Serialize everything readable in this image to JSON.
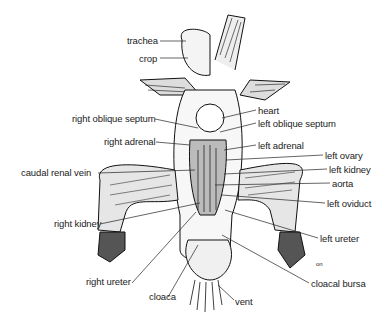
{
  "diagram": {
    "type": "anatomical-illustration",
    "labels": [
      {
        "id": "trachea",
        "text": "trachea",
        "x": 127,
        "y": 35,
        "side": "left"
      },
      {
        "id": "crop",
        "text": "crop",
        "x": 139,
        "y": 53,
        "side": "left"
      },
      {
        "id": "right-oblique-septum",
        "text": "right oblique septum",
        "x": 72,
        "y": 113,
        "side": "left"
      },
      {
        "id": "right-adrenal",
        "text": "right adrenal",
        "x": 104,
        "y": 136,
        "side": "left"
      },
      {
        "id": "caudal-renal-vein",
        "text": "caudal renal vein",
        "x": 21,
        "y": 167,
        "side": "left"
      },
      {
        "id": "right-kidney",
        "text": "right kidney",
        "x": 54,
        "y": 218,
        "side": "left"
      },
      {
        "id": "right-ureter",
        "text": "right ureter",
        "x": 86,
        "y": 276,
        "side": "left"
      },
      {
        "id": "cloaca",
        "text": "cloaca",
        "x": 149,
        "y": 291,
        "side": "bottom"
      },
      {
        "id": "vent",
        "text": "vent",
        "x": 235,
        "y": 296,
        "side": "bottom"
      },
      {
        "id": "heart",
        "text": "heart",
        "x": 258,
        "y": 105,
        "side": "right"
      },
      {
        "id": "left-oblique-septum",
        "text": "left oblique septum",
        "x": 258,
        "y": 118,
        "side": "right"
      },
      {
        "id": "left-adrenal",
        "text": "left adrenal",
        "x": 258,
        "y": 140,
        "side": "right"
      },
      {
        "id": "left-ovary",
        "text": "left ovary",
        "x": 325,
        "y": 150,
        "side": "right"
      },
      {
        "id": "left-kidney",
        "text": "left kidney",
        "x": 329,
        "y": 164,
        "side": "right"
      },
      {
        "id": "aorta",
        "text": "aorta",
        "x": 332,
        "y": 178,
        "side": "right"
      },
      {
        "id": "left-oviduct",
        "text": "left oviduct",
        "x": 327,
        "y": 198,
        "side": "right"
      },
      {
        "id": "left-ureter",
        "text": "left ureter",
        "x": 320,
        "y": 233,
        "side": "right"
      },
      {
        "id": "cloacal-bursa",
        "text": "cloacal bursa",
        "x": 311,
        "y": 278,
        "side": "right"
      }
    ],
    "annotations": [
      {
        "text": "on",
        "x": 316,
        "y": 259
      }
    ]
  }
}
